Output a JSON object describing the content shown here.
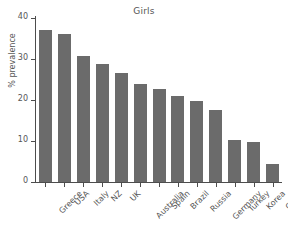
{
  "chart_data": {
    "type": "bar",
    "title": "Girls",
    "xlabel": "",
    "ylabel": "% prevalence",
    "categories": [
      "Greece",
      "USA",
      "Italy",
      "NZ",
      "UK",
      "Australia",
      "Spain",
      "Brazil",
      "Russia",
      "Germany",
      "Turkey",
      "Korea",
      "China"
    ],
    "values": [
      37.0,
      36.0,
      30.7,
      28.8,
      26.6,
      23.9,
      22.7,
      21.1,
      19.7,
      17.5,
      10.2,
      9.8,
      4.5
    ],
    "ylim": [
      0,
      40
    ],
    "yticks": [
      0,
      10,
      20,
      30,
      40
    ],
    "ytick_labels": [
      "0",
      "10",
      "20",
      "30",
      "40"
    ],
    "grid": false,
    "legend": false,
    "bar_color": "#6b6b6b",
    "axis_color": "#4d4d4d",
    "text_color": "#555555",
    "background": "#ffffff"
  }
}
